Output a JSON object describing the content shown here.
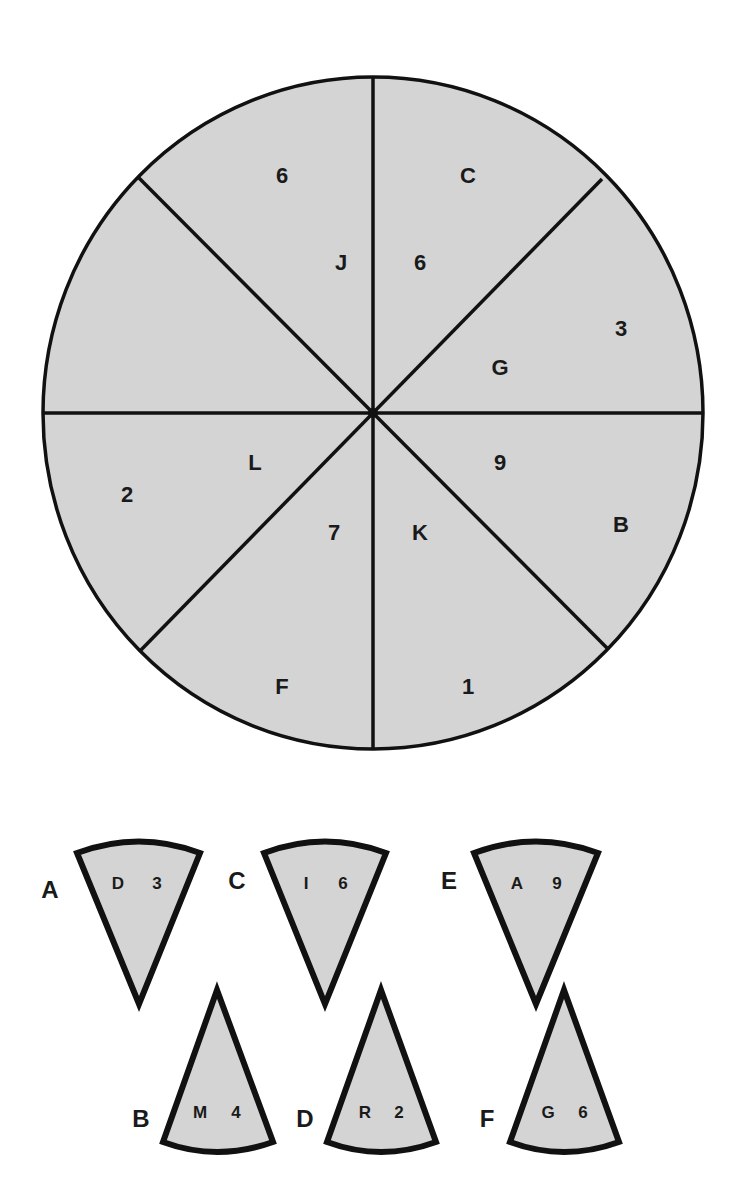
{
  "puzzle": {
    "type": "circle-segment-missing-piece",
    "circle": {
      "fill": "#d4d4d4",
      "stroke": "#111111",
      "segments": [
        {
          "position": "top-left-upper",
          "outer": "6",
          "inner": "J"
        },
        {
          "position": "top-right-upper",
          "outer": "C",
          "inner": "6"
        },
        {
          "position": "right-upper",
          "outer": "3",
          "inner": "G"
        },
        {
          "position": "right-lower",
          "outer": "B",
          "inner": "9"
        },
        {
          "position": "bottom-right",
          "outer": "1",
          "inner": "K"
        },
        {
          "position": "bottom-left",
          "outer": "F",
          "inner": "7"
        },
        {
          "position": "left-lower",
          "outer": "2",
          "inner": "L"
        },
        {
          "position": "left-upper",
          "outer": "",
          "inner": ""
        }
      ]
    },
    "options": [
      {
        "label": "A",
        "letter": "D",
        "number": "3",
        "orientation": "point-down"
      },
      {
        "label": "C",
        "letter": "I",
        "number": "6",
        "orientation": "point-down"
      },
      {
        "label": "E",
        "letter": "A",
        "number": "9",
        "orientation": "point-down"
      },
      {
        "label": "B",
        "letter": "M",
        "number": "4",
        "orientation": "point-up"
      },
      {
        "label": "D",
        "letter": "R",
        "number": "2",
        "orientation": "point-up"
      },
      {
        "label": "F",
        "letter": "G",
        "number": "6",
        "orientation": "point-up"
      }
    ]
  }
}
